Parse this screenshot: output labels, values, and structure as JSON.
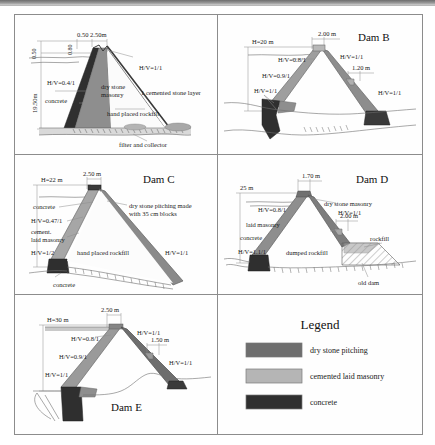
{
  "figure": {
    "type": "engineering-cross-section-plate",
    "panel_count": 6,
    "colors": {
      "dry_stone_pitching": "#6e6e6e",
      "cemented_laid_masonry": "#b5b5b5",
      "concrete": "#2f2f2f",
      "rockfill": "#9a9a9a",
      "ground_line": "#6f6f6f",
      "paper": "#fefefe",
      "border": "#8c8c8c"
    }
  },
  "panels": {
    "dam_a": {
      "title": "",
      "labels": {
        "crest_dims": "0.50 2.50m",
        "crest_height": "0.80",
        "dam_height": "19.50m",
        "left_scale": "0.50",
        "upstream_slope": "H/V=0.4/1",
        "downstream_slope": "H/V=1/1",
        "material_concrete": "concrete",
        "material_dry_stone": "dry stone masonry",
        "cemented_layer": "1 cemented stone layer",
        "fill": "hand placed rockfill",
        "drain": "filter and collector"
      }
    },
    "dam_b": {
      "title": "Dam B",
      "labels": {
        "height": "H=20 m",
        "crest_width": "2.00 m",
        "downstream_step": "1.20 m",
        "slope_upper_us": "H/V=0.8/1",
        "slope_mid_us": "H/V=0.9/1",
        "slope_lower_us": "H/V=1/1",
        "slope_upper_ds": "H/V=1/1",
        "slope_lower_ds": "H/V=1/1"
      }
    },
    "dam_c": {
      "title": "Dam C",
      "labels": {
        "height": "H=22 m",
        "crest_width": "2.50 m",
        "material_concrete_top": "concrete",
        "slope_us": "H/V=0.47/1",
        "material_masonry": "cement. laid masonry",
        "slope_lower_us": "H/V=1/2",
        "fill": "hand placed rockfill",
        "pitching": "dry stone pitching made with 35 cm blocks",
        "slope_ds": "H/V=1/1",
        "material_concrete_base": "concrete"
      }
    },
    "dam_d": {
      "title": "Dam D",
      "labels": {
        "height": "25 m",
        "crest_width": "1.70 m",
        "downstream_step": "2.00 m",
        "slope_us": "H/V=0.8/1",
        "material_masonry": "laid masonry",
        "material_concrete": "concrete",
        "slope_lower_us": "H/V=1.1/1",
        "pitching": "dry stone masonry",
        "slope_ds": "H/V=1/1",
        "fill": "dumped rockfill",
        "rockfill": "rockfill",
        "old_dam": "old dam"
      }
    },
    "dam_e": {
      "title": "Dam E",
      "labels": {
        "height": "H=30 m",
        "crest_width": "2.50 m",
        "downstream_step": "1.50 m",
        "slope_upper_us": "H/V=0.8/1",
        "slope_mid_us": "H/V=0.9/1",
        "slope_lower_us": "H/V=1/1",
        "slope_upper_ds": "H/V=1/1",
        "slope_lower_ds": "H/V=1/1"
      }
    },
    "legend": {
      "title": "Legend",
      "entries": [
        {
          "label": "dry stone pitching",
          "color": "#6e6e6e"
        },
        {
          "label": "cemented laid masonry",
          "color": "#b5b5b5"
        },
        {
          "label": "concrete",
          "color": "#2f2f2f"
        }
      ]
    }
  }
}
